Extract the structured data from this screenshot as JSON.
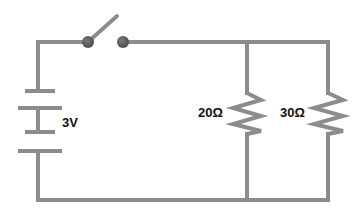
{
  "diagram": {
    "type": "circuit",
    "battery": {
      "label": "3V"
    },
    "switch": {
      "state": "open"
    },
    "resistors": [
      {
        "label": "20Ω"
      },
      {
        "label": "30Ω"
      }
    ],
    "colors": {
      "wire": "#8c8c8c",
      "wire_highlight": "#a8a8a8",
      "contact": "#5e5e5e",
      "text": "#111111"
    }
  }
}
